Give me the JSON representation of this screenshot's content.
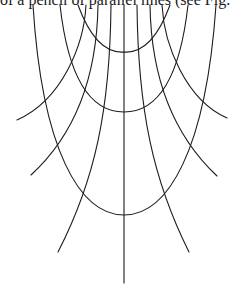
{
  "caption": {
    "text": "of a pencil of parallel lines (see Fig. 3) i"
  },
  "figure": {
    "stroke_color": "#1c1c1c",
    "background": "#ffffff",
    "axis_of_symmetry_x": 124,
    "u_curves": [
      {
        "name": "top-u",
        "vertex_y": 52
      },
      {
        "name": "middle-u",
        "vertex_y": 112
      },
      {
        "name": "bottom-u",
        "vertex_y": 215
      }
    ],
    "fan_lines_count": 7
  }
}
